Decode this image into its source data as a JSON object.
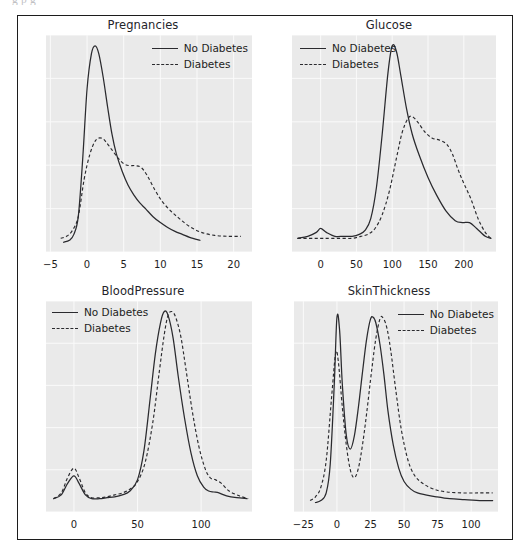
{
  "page": {
    "top_cut_text": "g           p                                              g"
  },
  "legend": {
    "no_diabetes": "No Diabetes",
    "diabetes": "Diabetes"
  },
  "chart_data": [
    {
      "type": "line",
      "title": "Pregnancies",
      "xlabel": "",
      "ylabel": "",
      "grid": true,
      "legend_position": "upper right",
      "xlim": [
        -5.6,
        22.5
      ],
      "xticks": [
        -5,
        0,
        5,
        10,
        15,
        20
      ],
      "xticklabels": [
        "−5",
        "0",
        "5",
        "10",
        "15",
        "20"
      ],
      "series": [
        {
          "name": "No Diabetes",
          "style": "solid",
          "x": [
            -3.2,
            -2.4,
            -1.8,
            -1.2,
            -0.6,
            0.0,
            0.6,
            1.1,
            1.6,
            2.2,
            2.8,
            3.4,
            4.0,
            4.8,
            5.6,
            6.4,
            7.2,
            8.0,
            9.0,
            10.0,
            11.0,
            12.0,
            13.0,
            14.0,
            15.4
          ],
          "y": [
            0.0,
            0.01,
            0.04,
            0.13,
            0.42,
            0.78,
            0.96,
            1.0,
            0.96,
            0.84,
            0.69,
            0.55,
            0.45,
            0.36,
            0.29,
            0.24,
            0.2,
            0.17,
            0.13,
            0.1,
            0.075,
            0.055,
            0.04,
            0.025,
            0.01
          ]
        },
        {
          "name": "Diabetes",
          "style": "dashed",
          "x": [
            -3.6,
            -2.8,
            -2.0,
            -1.2,
            -0.4,
            0.4,
            1.2,
            2.0,
            2.6,
            3.4,
            4.2,
            5.0,
            5.8,
            6.6,
            7.4,
            8.2,
            9.2,
            10.2,
            11.4,
            12.6,
            14.0,
            15.6,
            17.4,
            19.2,
            21.0
          ],
          "y": [
            0.02,
            0.03,
            0.06,
            0.13,
            0.32,
            0.45,
            0.52,
            0.53,
            0.51,
            0.47,
            0.43,
            0.4,
            0.39,
            0.39,
            0.38,
            0.34,
            0.27,
            0.21,
            0.16,
            0.12,
            0.08,
            0.05,
            0.035,
            0.03,
            0.03
          ]
        }
      ]
    },
    {
      "type": "line",
      "title": "Glucose",
      "xlabel": "",
      "ylabel": "",
      "grid": true,
      "legend_position": "upper left",
      "xlim": [
        -40,
        245
      ],
      "xticks": [
        0,
        50,
        100,
        150,
        200
      ],
      "xticklabels": [
        "0",
        "50",
        "100",
        "150",
        "200"
      ],
      "series": [
        {
          "name": "No Diabetes",
          "style": "solid",
          "x": [
            -32,
            -18,
            -6,
            0,
            8,
            20,
            32,
            44,
            54,
            62,
            70,
            78,
            86,
            94,
            100,
            106,
            112,
            120,
            128,
            138,
            150,
            162,
            175,
            188,
            198,
            208,
            218,
            230,
            238
          ],
          "y": [
            0.02,
            0.03,
            0.05,
            0.07,
            0.05,
            0.03,
            0.03,
            0.03,
            0.04,
            0.06,
            0.12,
            0.28,
            0.55,
            0.86,
            1.0,
            0.97,
            0.85,
            0.68,
            0.55,
            0.44,
            0.33,
            0.24,
            0.16,
            0.11,
            0.1,
            0.1,
            0.07,
            0.03,
            0.02
          ]
        },
        {
          "name": "Diabetes",
          "style": "dashed",
          "x": [
            -32,
            -18,
            -6,
            4,
            16,
            30,
            44,
            56,
            66,
            76,
            86,
            96,
            106,
            114,
            122,
            128,
            136,
            146,
            156,
            166,
            176,
            184,
            192,
            200,
            210,
            220,
            230,
            238
          ],
          "y": [
            0.02,
            0.02,
            0.02,
            0.02,
            0.02,
            0.02,
            0.02,
            0.03,
            0.04,
            0.07,
            0.14,
            0.26,
            0.43,
            0.56,
            0.63,
            0.64,
            0.61,
            0.56,
            0.53,
            0.52,
            0.5,
            0.45,
            0.37,
            0.3,
            0.22,
            0.12,
            0.05,
            0.02
          ]
        }
      ]
    },
    {
      "type": "line",
      "title": "BloodPressure",
      "xlabel": "",
      "ylabel": "",
      "grid": true,
      "legend_position": "upper left",
      "xlim": [
        -22,
        140
      ],
      "xticks": [
        0,
        50,
        100
      ],
      "xticklabels": [
        "0",
        "50",
        "100"
      ],
      "series": [
        {
          "name": "No Diabetes",
          "style": "solid",
          "x": [
            -16,
            -10,
            -5,
            0,
            4,
            9,
            14,
            20,
            26,
            32,
            38,
            44,
            50,
            55,
            60,
            64,
            68,
            71,
            74,
            78,
            82,
            87,
            92,
            97,
            102,
            106,
            110,
            114,
            120,
            128,
            136
          ],
          "y": [
            0.02,
            0.04,
            0.1,
            0.14,
            0.1,
            0.04,
            0.02,
            0.02,
            0.025,
            0.03,
            0.04,
            0.06,
            0.12,
            0.27,
            0.55,
            0.78,
            0.94,
            1.0,
            0.98,
            0.86,
            0.66,
            0.44,
            0.26,
            0.14,
            0.08,
            0.06,
            0.055,
            0.05,
            0.035,
            0.025,
            0.02
          ]
        },
        {
          "name": "Diabetes",
          "style": "dashed",
          "x": [
            -16,
            -10,
            -5,
            0,
            4,
            9,
            14,
            20,
            26,
            32,
            38,
            44,
            50,
            56,
            62,
            67,
            71,
            74,
            77,
            80,
            84,
            88,
            93,
            98,
            103,
            107,
            111,
            116,
            122,
            130,
            137
          ],
          "y": [
            0.02,
            0.05,
            0.13,
            0.18,
            0.13,
            0.05,
            0.025,
            0.025,
            0.03,
            0.04,
            0.05,
            0.07,
            0.11,
            0.21,
            0.42,
            0.68,
            0.88,
            0.98,
            1.0,
            0.97,
            0.87,
            0.7,
            0.48,
            0.3,
            0.18,
            0.13,
            0.12,
            0.1,
            0.06,
            0.035,
            0.02
          ]
        }
      ]
    },
    {
      "type": "line",
      "title": "SkinThickness",
      "xlabel": "",
      "ylabel": "",
      "grid": true,
      "legend_position": "upper right",
      "xlim": [
        -32,
        120
      ],
      "xticks": [
        -25,
        0,
        25,
        50,
        75,
        100
      ],
      "xticklabels": [
        "−25",
        "0",
        "25",
        "50",
        "75",
        "100"
      ],
      "series": [
        {
          "name": "No Diabetes",
          "style": "solid",
          "x": [
            -16,
            -12,
            -8,
            -5,
            -2,
            0,
            2,
            4,
            7,
            10,
            13,
            16,
            19,
            22,
            25,
            27,
            29,
            32,
            35,
            38,
            42,
            46,
            50,
            55,
            60,
            66,
            74,
            84,
            95,
            108,
            116
          ],
          "y": [
            0.0,
            0.01,
            0.05,
            0.2,
            0.62,
            0.97,
            0.9,
            0.62,
            0.35,
            0.28,
            0.35,
            0.5,
            0.68,
            0.85,
            0.96,
            0.97,
            0.94,
            0.83,
            0.67,
            0.48,
            0.3,
            0.18,
            0.11,
            0.07,
            0.05,
            0.04,
            0.03,
            0.02,
            0.015,
            0.01,
            0.01
          ]
        },
        {
          "name": "Diabetes",
          "style": "dashed",
          "x": [
            -20,
            -16,
            -12,
            -8,
            -4,
            -1,
            1,
            4,
            7,
            10,
            13,
            16,
            19,
            22,
            26,
            29,
            32,
            34,
            37,
            40,
            44,
            48,
            53,
            58,
            64,
            72,
            82,
            94,
            106,
            116
          ],
          "y": [
            0.01,
            0.03,
            0.08,
            0.22,
            0.55,
            0.78,
            0.74,
            0.5,
            0.3,
            0.17,
            0.13,
            0.18,
            0.3,
            0.46,
            0.7,
            0.86,
            0.96,
            0.97,
            0.92,
            0.8,
            0.58,
            0.38,
            0.22,
            0.14,
            0.1,
            0.07,
            0.055,
            0.05,
            0.05,
            0.05
          ]
        }
      ]
    }
  ]
}
